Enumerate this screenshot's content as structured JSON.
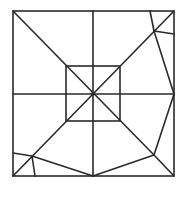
{
  "diagram": {
    "stroke_color": "#2a2a2a",
    "background": "#ffffff",
    "outer_square": {
      "x1": 13,
      "y1": 11,
      "x2": 174,
      "y2": 176
    },
    "inner_square": {
      "x1": 66,
      "y1": 66,
      "x2": 120,
      "y2": 121
    },
    "center": {
      "x": 93,
      "y": 94
    },
    "segments": [
      {
        "name": "vertical-midline",
        "x1": 93,
        "y1": 11,
        "x2": 93,
        "y2": 176
      },
      {
        "name": "horizontal-midline",
        "x1": 13,
        "y1": 94,
        "x2": 174,
        "y2": 94
      },
      {
        "name": "diagonal-top-left-to-bottom-right-inner",
        "x1": 13,
        "y1": 11,
        "x2": 154,
        "y2": 155
      },
      {
        "name": "diagonal-bottom-right-corner",
        "x1": 154,
        "y1": 155,
        "x2": 174,
        "y2": 176
      },
      {
        "name": "diagonal-bottom-left-to-top-right",
        "x1": 13,
        "y1": 176,
        "x2": 174,
        "y2": 11
      },
      {
        "name": "top-right-flap-edge-a",
        "x1": 150,
        "y1": 11,
        "x2": 154,
        "y2": 31
      },
      {
        "name": "top-right-flap-edge-b",
        "x1": 154,
        "y1": 31,
        "x2": 174,
        "y2": 34
      },
      {
        "name": "right-kite-upper",
        "x1": 154,
        "y1": 31,
        "x2": 174,
        "y2": 94
      },
      {
        "name": "right-kite-lower",
        "x1": 174,
        "y1": 94,
        "x2": 154,
        "y2": 155
      },
      {
        "name": "bottom-kite-right",
        "x1": 154,
        "y1": 155,
        "x2": 93,
        "y2": 176
      },
      {
        "name": "bottom-kite-left",
        "x1": 32,
        "y1": 156,
        "x2": 93,
        "y2": 176
      },
      {
        "name": "bottom-left-flap-edge-a",
        "x1": 13,
        "y1": 153,
        "x2": 32,
        "y2": 156
      },
      {
        "name": "bottom-left-flap-edge-b",
        "x1": 32,
        "y1": 156,
        "x2": 35,
        "y2": 176
      }
    ]
  }
}
